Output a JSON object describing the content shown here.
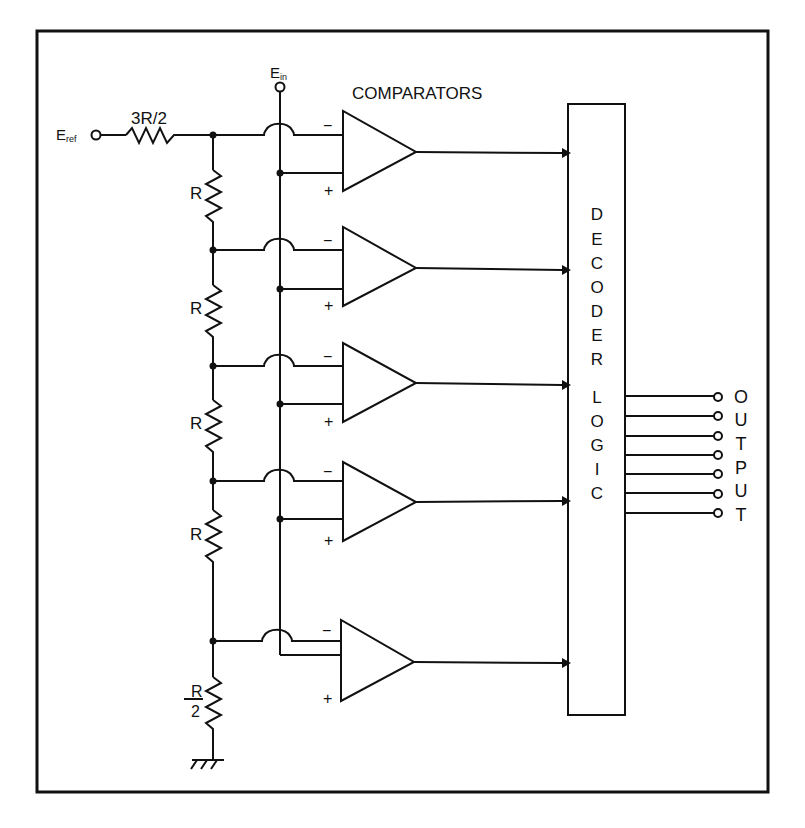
{
  "diagram": {
    "title_label": "COMPARATORS",
    "input_reference_label": "E",
    "input_reference_sub": "ref",
    "input_signal_label": "E",
    "input_signal_sub": "in",
    "top_resistor_label": "3R/2",
    "ladder_resistors": [
      {
        "label": "R"
      },
      {
        "label": "R"
      },
      {
        "label": "R"
      },
      {
        "label": "R"
      }
    ],
    "bottom_resistor": {
      "numerator": "R",
      "denominator": "2"
    },
    "comparator_inputs": {
      "minus": "−",
      "plus": "+"
    },
    "comparators": [
      {
        "id": 1
      },
      {
        "id": 2
      },
      {
        "id": 3
      },
      {
        "id": 4
      },
      {
        "id": 5
      }
    ],
    "decoder": {
      "word1": [
        "D",
        "E",
        "C",
        "O",
        "D",
        "E",
        "R"
      ],
      "word2": [
        "L",
        "O",
        "G",
        "I",
        "C"
      ]
    },
    "output_label_letters": [
      "O",
      "U",
      "T",
      "P",
      "U",
      "T"
    ],
    "output_line_count": 7,
    "colors": {
      "ink": "#111111",
      "background": "#ffffff"
    }
  }
}
